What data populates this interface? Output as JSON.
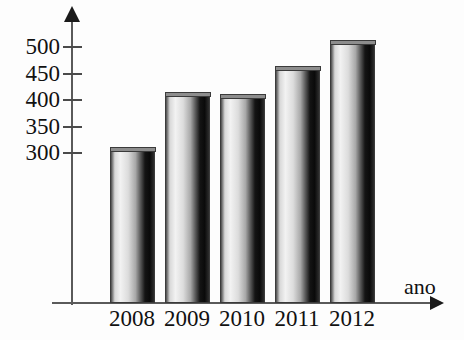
{
  "chart_data": {
    "type": "bar",
    "title": "",
    "xlabel": "ano",
    "ylabel": "",
    "categories": [
      "2008",
      "2009",
      "2010",
      "2011",
      "2012"
    ],
    "values": [
      310,
      415,
      410,
      463,
      513
    ],
    "ylim": [
      275,
      525
    ],
    "ytick_values": [
      300,
      350,
      400,
      450,
      500
    ],
    "ytick_labels": [
      "300",
      "350",
      "400",
      "450",
      "500"
    ],
    "grid": false,
    "legend": null,
    "annotations": [],
    "axis_arrows": {
      "x": "right",
      "y": "up"
    },
    "bar_style": "3d-cylinder-gradient"
  },
  "axes": {
    "x_title": "ano",
    "y_title": ""
  },
  "icons": {
    "y_axis_arrow": "arrow-up-icon",
    "x_axis_arrow": "arrow-right-icon"
  },
  "colors": {
    "background": "#fdfdfd",
    "axis": "#5a5a5a",
    "arrow": "#1a1a1a",
    "text": "#111111",
    "bar_outline": "#3b3b3b",
    "bar_light": "#f2f2f2",
    "bar_dark": "#0a0a0a"
  }
}
